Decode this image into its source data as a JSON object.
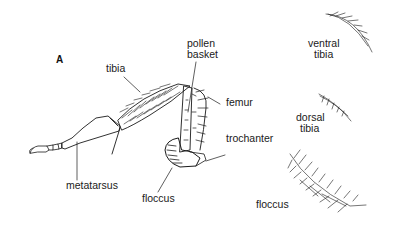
{
  "figure": {
    "panel_label": "A",
    "labels": {
      "tibia": "tibia",
      "pollen_basket_1": "pollen",
      "pollen_basket_2": "basket",
      "femur": "femur",
      "trochanter": "trochanter",
      "metatarsus": "metatarsus",
      "floccus_leg": "floccus",
      "ventral_tibia_1": "ventral",
      "ventral_tibia_2": "tibia",
      "dorsal_tibia_1": "dorsal",
      "dorsal_tibia_2": "tibia",
      "floccus_hair": "floccus"
    },
    "colors": {
      "ink": "#1a1a1a",
      "background": "#ffffff"
    }
  }
}
